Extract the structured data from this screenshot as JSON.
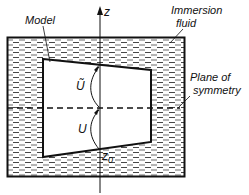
{
  "labels": {
    "axis": "z",
    "model": "Model",
    "fluid_line1": "Immersion",
    "fluid_line2": "fluid",
    "plane_line1": "Plane of",
    "plane_line2": "symmetry",
    "u_tilde": "Ũ",
    "u": "U",
    "z0": "z",
    "z0_sub": "0"
  },
  "colors": {
    "ink": "#111111",
    "background": "#ffffff"
  }
}
